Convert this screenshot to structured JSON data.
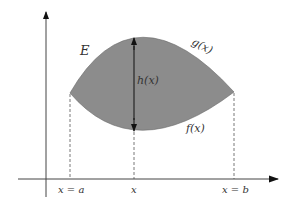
{
  "diagram": {
    "region_label": "E",
    "upper_curve_label": "g(x)",
    "lower_curve_label": "f(x)",
    "height_label": "h(x)",
    "x_ticks": [
      {
        "label": "x = a",
        "x": 70
      },
      {
        "label": "x",
        "x": 134
      },
      {
        "label": "x = b",
        "x": 234
      }
    ],
    "colors": {
      "fill": "#8c8c8c",
      "axis": "#333333",
      "arrow": "#111111"
    }
  }
}
